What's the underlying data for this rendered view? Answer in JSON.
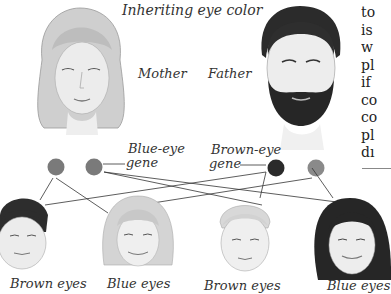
{
  "figure": {
    "title": "Inheriting eye color",
    "parents": [
      {
        "label": "Mother",
        "hair": "blonde bob",
        "genes": [
          "blue",
          "blue"
        ]
      },
      {
        "label": "Father",
        "hair": "dark, bearded",
        "genes": [
          "brown",
          "blue"
        ]
      }
    ],
    "gene_labels": {
      "blue": [
        "Blue-eye",
        "gene"
      ],
      "brown": [
        "Brown-eye",
        "gene"
      ]
    },
    "gene_colors": {
      "blue": "#7a7a7a",
      "brown": "#2a2a2a",
      "recessive_father": "#8a8a8a"
    },
    "children": [
      {
        "caption": "Brown eyes"
      },
      {
        "caption": "Blue eyes"
      },
      {
        "caption": "Brown eyes"
      },
      {
        "caption": "Blue eyes"
      }
    ]
  },
  "side_text": {
    "lines": [
      "to",
      "is",
      "w",
      "pl",
      "if",
      "co",
      "co",
      "pl",
      "dı"
    ]
  }
}
